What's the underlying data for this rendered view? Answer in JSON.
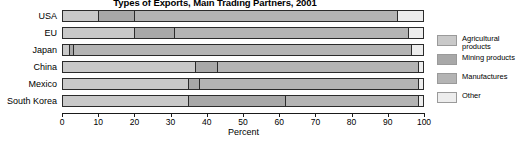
{
  "chart_data": {
    "type": "bar",
    "orientation": "horizontal",
    "stacked": true,
    "normalized_percent": true,
    "title": "Types of Exports, Main Trading Partners, 2001",
    "xlabel": "Percent",
    "ylabel": "",
    "xlim": [
      0,
      100
    ],
    "xticks": [
      0,
      10,
      20,
      30,
      40,
      50,
      60,
      70,
      80,
      90,
      100
    ],
    "xtick_labels": [
      "0",
      "10",
      "20",
      "30",
      "40",
      "50",
      "60",
      "70",
      "80",
      "90",
      "100"
    ],
    "grid": false,
    "legend_position": "right",
    "categories": [
      "USA",
      "EU",
      "Japan",
      "China",
      "Mexico",
      "South Korea"
    ],
    "series": [
      {
        "name": "Agricultural products",
        "color": "#c9c9c9",
        "values": [
          10,
          20,
          2,
          37,
          35,
          35
        ]
      },
      {
        "name": "Mining products",
        "color": "#a8a8a8",
        "values": [
          10,
          11,
          1,
          6,
          3,
          27
        ]
      },
      {
        "name": "Manufactures",
        "color": "#b4b4b4",
        "values": [
          73,
          65,
          94,
          56,
          61,
          37
        ]
      },
      {
        "name": "Other",
        "color": "#ededed",
        "values": [
          7,
          4,
          3,
          1,
          1,
          1
        ]
      }
    ]
  },
  "axis": {
    "x_title": "Percent"
  },
  "legend": {
    "items": [
      {
        "label": "Agricultural products",
        "color": "#c9c9c9"
      },
      {
        "label": "Mining products",
        "color": "#a8a8a8"
      },
      {
        "label": "Manufactures",
        "color": "#b4b4b4"
      },
      {
        "label": "Other",
        "color": "#ededed"
      }
    ]
  }
}
